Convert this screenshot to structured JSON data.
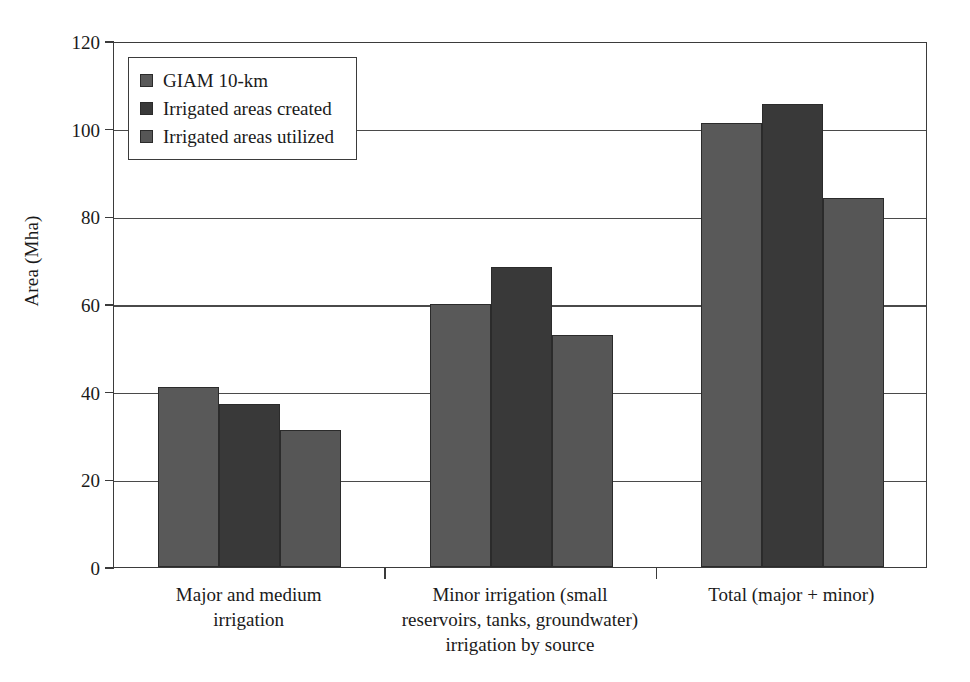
{
  "chart_data": {
    "type": "bar",
    "title": "",
    "xlabel": "",
    "ylabel": "Area (Mha)",
    "ylim": [
      0,
      120
    ],
    "ytick_step": 20,
    "yticks": [
      0,
      20,
      40,
      60,
      80,
      100,
      120
    ],
    "ytick_labels": [
      "0",
      "20",
      "40",
      "60",
      "80",
      "100",
      "120"
    ],
    "grid": "horizontal",
    "legend_position": "top-left-inside",
    "categories": [
      "Major and medium\nirrigation",
      "Minor irrigation (small\nreservoirs, tanks, groundwater)\nirrigation by source",
      "Total (major + minor)"
    ],
    "series": [
      {
        "name": "GIAM 10-km",
        "color": "#595959",
        "values": [
          41.1,
          60.0,
          101.3
        ]
      },
      {
        "name": "Irrigated areas created",
        "color": "#393939",
        "values": [
          37.1,
          68.5,
          105.6
        ]
      },
      {
        "name": "Irrigated areas utilized",
        "color": "#565656",
        "values": [
          31.2,
          53.0,
          84.3
        ]
      }
    ]
  },
  "legend": {
    "items": [
      {
        "label": "GIAM 10-km",
        "color": "#595959"
      },
      {
        "label": "Irrigated areas created",
        "color": "#393939"
      },
      {
        "label": "Irrigated areas utilized",
        "color": "#565656"
      }
    ]
  },
  "axes": {
    "y_title": "Area (Mha)"
  }
}
